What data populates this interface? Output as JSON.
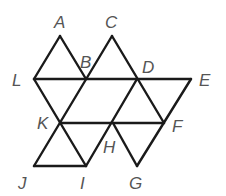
{
  "diagram": {
    "type": "geometric-figure",
    "stroke_color": "#1a1a1a",
    "label_color": "#555555",
    "points": {
      "A": {
        "x": 60,
        "y": 36
      },
      "C": {
        "x": 112,
        "y": 36
      },
      "L": {
        "x": 34,
        "y": 79
      },
      "B": {
        "x": 86,
        "y": 79
      },
      "D": {
        "x": 137,
        "y": 79
      },
      "E": {
        "x": 191,
        "y": 79
      },
      "K": {
        "x": 60,
        "y": 123
      },
      "H": {
        "x": 113,
        "y": 123
      },
      "F": {
        "x": 164,
        "y": 123
      },
      "J": {
        "x": 34,
        "y": 166
      },
      "I": {
        "x": 86,
        "y": 166
      },
      "G": {
        "x": 137,
        "y": 166
      }
    },
    "segments": [
      [
        "A",
        "L"
      ],
      [
        "A",
        "B"
      ],
      [
        "L",
        "E"
      ],
      [
        "C",
        "J"
      ],
      [
        "C",
        "F"
      ],
      [
        "L",
        "I"
      ],
      [
        "D",
        "I"
      ],
      [
        "E",
        "G"
      ],
      [
        "K",
        "F"
      ],
      [
        "J",
        "I"
      ],
      [
        "H",
        "G"
      ]
    ],
    "labels": [
      {
        "text": "A",
        "x": 54,
        "y": 28
      },
      {
        "text": "C",
        "x": 105,
        "y": 28
      },
      {
        "text": "B",
        "x": 80,
        "y": 68
      },
      {
        "text": "D",
        "x": 142,
        "y": 73
      },
      {
        "text": "L",
        "x": 12,
        "y": 86
      },
      {
        "text": "E",
        "x": 199,
        "y": 86
      },
      {
        "text": "K",
        "x": 37,
        "y": 129
      },
      {
        "text": "F",
        "x": 172,
        "y": 132
      },
      {
        "text": "H",
        "x": 103,
        "y": 153
      },
      {
        "text": "J",
        "x": 18,
        "y": 189
      },
      {
        "text": "I",
        "x": 80,
        "y": 189
      },
      {
        "text": "G",
        "x": 129,
        "y": 189
      }
    ]
  }
}
